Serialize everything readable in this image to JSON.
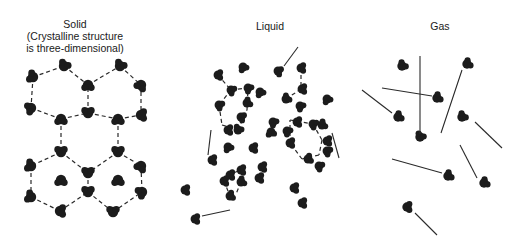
{
  "panels": {
    "solid": {
      "title": "Solid",
      "subtitle_line1": "(Crystalline structure",
      "subtitle_line2": "is three-dimensional)"
    },
    "liquid": {
      "title": "Liquid"
    },
    "gas": {
      "title": "Gas"
    }
  },
  "colors": {
    "molecule": "#1c1c1c",
    "line": "#2a2a2a",
    "background": "#ffffff"
  }
}
